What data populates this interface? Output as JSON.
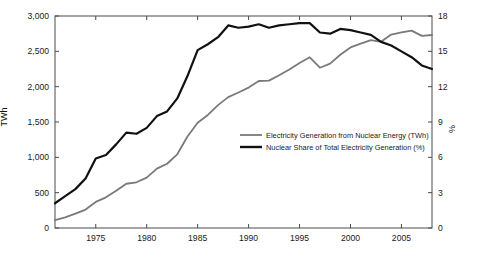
{
  "axis_titles": {
    "left": "TWh",
    "right": "%"
  },
  "chart_data": {
    "type": "line",
    "title": "",
    "subtitle": "",
    "xlabel": "",
    "ylabel": "TWh",
    "y2label": "%",
    "xlim": [
      1971,
      2008
    ],
    "ylim": [
      0,
      3000
    ],
    "y2lim": [
      0,
      18
    ],
    "grid": false,
    "legend_position": "center-right-inside",
    "xticks": [
      1975,
      1980,
      1985,
      1990,
      1995,
      2000,
      2005
    ],
    "xticklabels": [
      "1975",
      "1980",
      "1985",
      "1990",
      "1995",
      "2000",
      "2005"
    ],
    "yticks": [
      0,
      500,
      1000,
      1500,
      2000,
      2500,
      3000
    ],
    "yticklabels": [
      "0",
      "500",
      "1,000",
      "1,500",
      "2,000",
      "2,500",
      "3,000"
    ],
    "y2ticks": [
      0,
      3,
      6,
      9,
      12,
      15,
      18
    ],
    "y2ticklabels": [
      "0",
      "3",
      "6",
      "9",
      "12",
      "15",
      "18"
    ],
    "x": [
      1971,
      1972,
      1973,
      1974,
      1975,
      1976,
      1977,
      1978,
      1979,
      1980,
      1981,
      1982,
      1983,
      1984,
      1985,
      1986,
      1987,
      1988,
      1989,
      1990,
      1991,
      1992,
      1993,
      1994,
      1995,
      1996,
      1997,
      1998,
      1999,
      2000,
      2001,
      2002,
      2003,
      2004,
      2005,
      2006,
      2007,
      2008
    ],
    "series": [
      {
        "name": "Electricity Generation from Nuclear Energy (TWh)",
        "axis": "left",
        "color": "#7a7a7a",
        "width": 1.8,
        "values": [
          111,
          150,
          203,
          261,
          369,
          434,
          527,
          626,
          647,
          712,
          840,
          909,
          1043,
          1294,
          1490,
          1600,
          1739,
          1852,
          1918,
          1987,
          2080,
          2086,
          2162,
          2244,
          2335,
          2416,
          2268,
          2327,
          2451,
          2555,
          2610,
          2660,
          2635,
          2738,
          2768,
          2793,
          2719,
          2731
        ]
      },
      {
        "name": "Nuclear Share of Total Electricity Generation (%)",
        "axis": "right",
        "color": "#111111",
        "width": 2.2,
        "values": [
          2.1,
          2.7,
          3.3,
          4.2,
          5.9,
          6.2,
          7.1,
          8.1,
          8.0,
          8.5,
          9.5,
          9.9,
          11.0,
          12.9,
          15.1,
          15.6,
          16.2,
          17.2,
          17.0,
          17.1,
          17.3,
          17.0,
          17.2,
          17.3,
          17.4,
          17.4,
          16.6,
          16.5,
          16.9,
          16.8,
          16.6,
          16.4,
          15.8,
          15.5,
          15.0,
          14.5,
          13.8,
          13.5
        ]
      }
    ],
    "legend": [
      {
        "label": "Electricity Generation from Nuclear Energy (TWh)",
        "color": "#7a7a7a",
        "width": 1.8
      },
      {
        "label": "Nuclear Share of Total Electricity Generation (%)",
        "color": "#111111",
        "width": 2.4
      }
    ]
  }
}
